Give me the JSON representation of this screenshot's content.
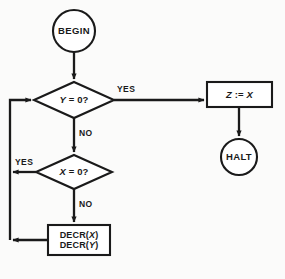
{
  "diagram": {
    "type": "flowchart",
    "title": "",
    "colors": {
      "background": "#fbfbfa",
      "stroke": "#1a1a1a",
      "shape_fill": "#ffffff",
      "text": "#1a1a1a"
    },
    "nodes": [
      {
        "id": "begin",
        "shape": "circle",
        "label": "BEGIN",
        "cx": 74,
        "cy": 31,
        "r": 21
      },
      {
        "id": "test_y",
        "shape": "diamond",
        "label_prefix": "Y",
        "label_suffix": " = 0?",
        "label": "Y = 0?",
        "cx": 74,
        "cy": 100,
        "half_width": 40,
        "half_height": 18
      },
      {
        "id": "assign_z",
        "shape": "rectangle",
        "label_prefix": "Z",
        "label_middle": " := ",
        "label_suffix": "X",
        "label": "Z := X",
        "x": 207,
        "y": 82,
        "width": 65,
        "height": 25
      },
      {
        "id": "halt",
        "shape": "circle",
        "label": "HALT",
        "cx": 239,
        "cy": 157,
        "r": 18
      },
      {
        "id": "test_x",
        "shape": "diamond",
        "label_prefix": "X",
        "label_suffix": " = 0?",
        "label": "X = 0?",
        "cx": 74,
        "cy": 172,
        "half_width": 38,
        "half_height": 17
      },
      {
        "id": "decrement",
        "shape": "rectangle",
        "label_line1_prefix": "DECR(",
        "label_line1_var": "X",
        "label_line1_suffix": ")",
        "label_line2_prefix": "DECR(",
        "label_line2_var": "Y",
        "label_line2_suffix": ")",
        "label": "DECR(X) DECR(Y)",
        "x": 48,
        "y": 225,
        "width": 62,
        "height": 30
      }
    ],
    "edge_labels": {
      "yes_y": "YES",
      "no_y": "NO",
      "yes_x": "YES",
      "no_x": "NO"
    },
    "edges": [
      {
        "id": "begin-to-testy",
        "from": "begin",
        "to": "test_y",
        "label": ""
      },
      {
        "id": "testy-yes-to-assignz",
        "from": "test_y",
        "to": "assign_z",
        "label": "YES"
      },
      {
        "id": "assignz-to-halt",
        "from": "assign_z",
        "to": "halt",
        "label": ""
      },
      {
        "id": "testy-no-to-testx",
        "from": "test_y",
        "to": "test_x",
        "label": "NO"
      },
      {
        "id": "testx-yes-to-loop",
        "from": "test_x",
        "to": "test_y",
        "label": "YES"
      },
      {
        "id": "testx-no-to-decrement",
        "from": "test_x",
        "to": "decrement",
        "label": "NO"
      },
      {
        "id": "decrement-to-loop",
        "from": "decrement",
        "to": "test_y",
        "label": ""
      }
    ]
  }
}
